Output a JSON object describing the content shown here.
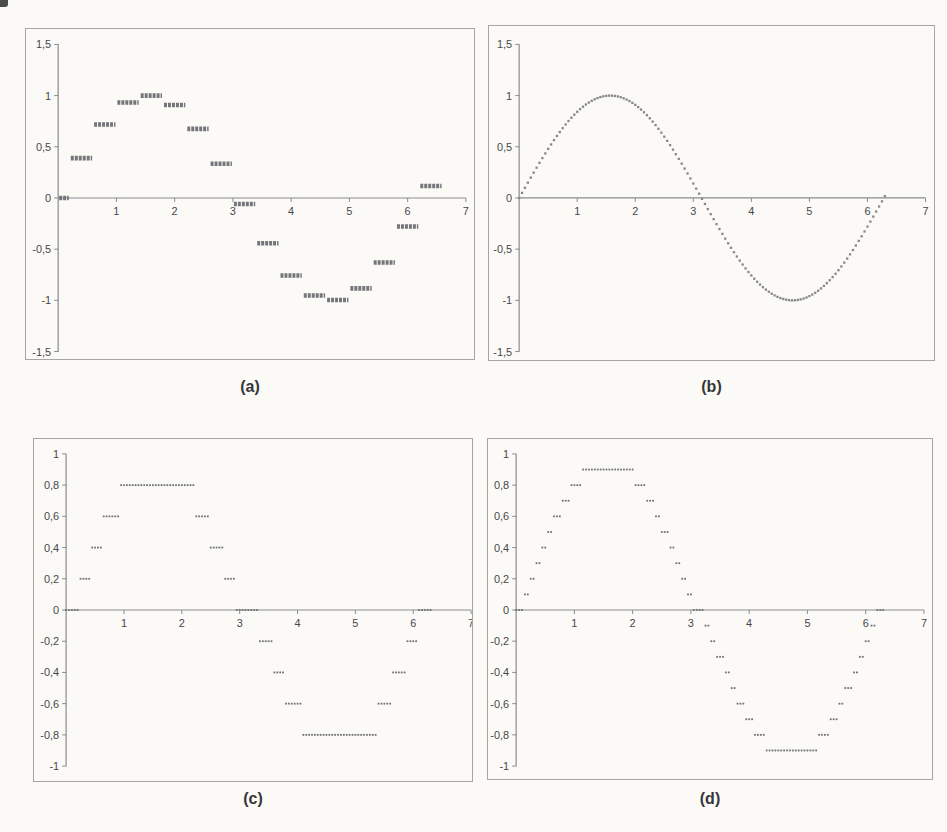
{
  "style": {
    "background": "#fbfaf7",
    "panel_border": "#a6a6a3",
    "axis_color": "#8a8c8e",
    "tick_text_color": "#47474a",
    "caption_color": "#363638"
  },
  "captions": {
    "a": "(a)",
    "b": "(b)",
    "c": "(c)",
    "d": "(d)"
  },
  "chart_data": [
    {
      "id": "a",
      "type": "scatter",
      "marker": "hold-segment",
      "title": "(a)",
      "color": "#74767a",
      "xlim": [
        0,
        7
      ],
      "ylim": [
        -1.5,
        1.5
      ],
      "x_tick_values": [
        1,
        2,
        3,
        4,
        5,
        6,
        7
      ],
      "x_tick_labels": [
        "1",
        "2",
        "3",
        "4",
        "5",
        "6",
        "7"
      ],
      "y_tick_values": [
        1.5,
        1,
        0.5,
        0,
        -0.5,
        -1,
        -1.5
      ],
      "y_tick_labels": [
        "1,5",
        "1",
        "0,5",
        "0",
        "-0,5",
        "-1",
        "-1,5"
      ],
      "series_name": "sin(x) sampled every 0.4 with zero-order hold",
      "segments": [
        {
          "x1": 0.0,
          "x2": 0.2,
          "y": 0.0
        },
        {
          "x1": 0.2,
          "x2": 0.6,
          "y": 0.389
        },
        {
          "x1": 0.6,
          "x2": 1.0,
          "y": 0.717
        },
        {
          "x1": 1.0,
          "x2": 1.4,
          "y": 0.932
        },
        {
          "x1": 1.4,
          "x2": 1.8,
          "y": 1.0
        },
        {
          "x1": 1.8,
          "x2": 2.2,
          "y": 0.909
        },
        {
          "x1": 2.2,
          "x2": 2.6,
          "y": 0.675
        },
        {
          "x1": 2.6,
          "x2": 3.0,
          "y": 0.335
        },
        {
          "x1": 3.0,
          "x2": 3.4,
          "y": -0.058
        },
        {
          "x1": 3.4,
          "x2": 3.8,
          "y": -0.443
        },
        {
          "x1": 3.8,
          "x2": 4.2,
          "y": -0.757
        },
        {
          "x1": 4.2,
          "x2": 4.6,
          "y": -0.952
        },
        {
          "x1": 4.6,
          "x2": 5.0,
          "y": -0.996
        },
        {
          "x1": 5.0,
          "x2": 5.4,
          "y": -0.883
        },
        {
          "x1": 5.4,
          "x2": 5.8,
          "y": -0.631
        },
        {
          "x1": 5.8,
          "x2": 6.2,
          "y": -0.279
        },
        {
          "x1": 6.2,
          "x2": 6.6,
          "y": 0.117
        }
      ]
    },
    {
      "id": "b",
      "type": "scatter",
      "marker": "dot",
      "title": "(b)",
      "color": "#85878a",
      "xlim": [
        0,
        7
      ],
      "ylim": [
        -1.5,
        1.5
      ],
      "x_tick_values": [
        1,
        2,
        3,
        4,
        5,
        6,
        7
      ],
      "x_tick_labels": [
        "1",
        "2",
        "3",
        "4",
        "5",
        "6",
        "7"
      ],
      "y_tick_values": [
        1.5,
        1,
        0.5,
        0,
        -0.5,
        -1,
        -1.5
      ],
      "y_tick_labels": [
        "1,5",
        "1",
        "0,5",
        "0",
        "-0,5",
        "-1",
        "-1,5"
      ],
      "series_name": "sin(x) finely sampled",
      "sampling": {
        "function": "sin",
        "x_start": 0,
        "x_end": 6.3,
        "x_step": 0.05,
        "quantize_step": null
      }
    },
    {
      "id": "c",
      "type": "scatter",
      "marker": "dot",
      "title": "(c)",
      "color": "#6f7174",
      "xlim": [
        0,
        7
      ],
      "ylim": [
        -1,
        1
      ],
      "x_tick_values": [
        1,
        2,
        3,
        4,
        5,
        6,
        7
      ],
      "x_tick_labels": [
        "1",
        "2",
        "3",
        "4",
        "5",
        "6",
        "7"
      ],
      "y_tick_values": [
        1,
        0.8,
        0.6,
        0.4,
        0.2,
        0,
        -0.2,
        -0.4,
        -0.6,
        -0.8,
        -1
      ],
      "y_tick_labels": [
        "1",
        "0,8",
        "0,6",
        "0,4",
        "0,2",
        "0",
        "-0,2",
        "-0,4",
        "-0,6",
        "-0,8",
        "-1"
      ],
      "series_name": "sin(x) quantized to 0.2 steps",
      "sampling": {
        "function": "sin",
        "x_start": 0,
        "x_end": 6.3,
        "x_step": 0.05,
        "quantize_step": 0.2
      }
    },
    {
      "id": "d",
      "type": "scatter",
      "marker": "dot",
      "title": "(d)",
      "color": "#6f7174",
      "xlim": [
        0,
        7
      ],
      "ylim": [
        -1,
        1
      ],
      "x_tick_values": [
        1,
        2,
        3,
        4,
        5,
        6,
        7
      ],
      "x_tick_labels": [
        "1",
        "2",
        "3",
        "4",
        "5",
        "6",
        "7"
      ],
      "y_tick_values": [
        1,
        0.8,
        0.6,
        0.4,
        0.2,
        0,
        -0.2,
        -0.4,
        -0.6,
        -0.8,
        -1
      ],
      "y_tick_labels": [
        "1",
        "0,8",
        "0,6",
        "0,4",
        "0,2",
        "0",
        "-0,2",
        "-0,4",
        "-0,6",
        "-0,8",
        "-1"
      ],
      "series_name": "sin(x) quantized to 0.1 steps",
      "sampling": {
        "function": "sin",
        "x_start": 0,
        "x_end": 6.3,
        "x_step": 0.05,
        "quantize_step": 0.1
      }
    }
  ]
}
